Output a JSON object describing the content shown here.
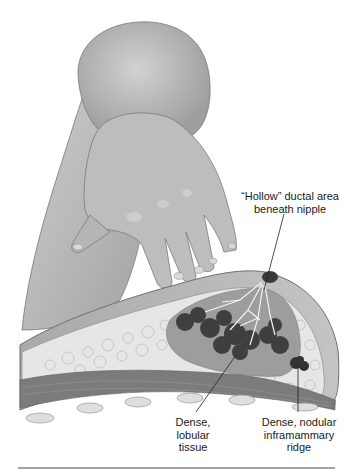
{
  "figure": {
    "type": "anatomical illustration",
    "colors": {
      "skin": "#b4b4b4",
      "skin_light": "#cfcfcf",
      "skin_shadow": "#8e8e8e",
      "fat": "#e9e9e9",
      "glandular": "#9a9a9a",
      "dense_lobules": "#3c3c3c",
      "ducts": "#f2f2f2",
      "muscle": "#7b7b7b",
      "rib": "#dcdcdc",
      "rule": "#a3a3a3"
    }
  },
  "labels": {
    "ductal": {
      "lines": [
        "“Hollow” ductal area",
        "beneath nipple"
      ]
    },
    "lobular": {
      "lines": [
        "Dense,",
        "lobular",
        "tissue"
      ]
    },
    "ridge": {
      "lines": [
        "Dense, nodular",
        "inframammary",
        "ridge"
      ]
    }
  }
}
